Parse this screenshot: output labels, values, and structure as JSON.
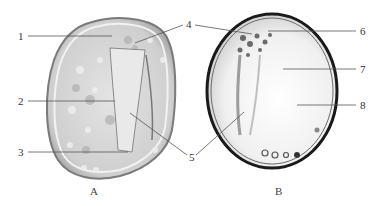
{
  "figure": {
    "panels": [
      {
        "id": "A",
        "label": "A",
        "description": "light micrograph of cell with irregular rounded outline and granular cytoplasm"
      },
      {
        "id": "B",
        "label": "B",
        "description": "light micrograph of oval cell with dark outline and large clear vacuole"
      }
    ],
    "callouts": [
      {
        "number": "1",
        "panel": "A",
        "side": "left"
      },
      {
        "number": "2",
        "panel": "A",
        "side": "left"
      },
      {
        "number": "3",
        "panel": "A",
        "side": "left"
      },
      {
        "number": "4",
        "panel": "A+B",
        "side": "top-center"
      },
      {
        "number": "5",
        "panel": "A+B",
        "side": "bottom-center"
      },
      {
        "number": "6",
        "panel": "B",
        "side": "right"
      },
      {
        "number": "7",
        "panel": "B",
        "side": "right"
      },
      {
        "number": "8",
        "panel": "B",
        "side": "right"
      }
    ],
    "caption_visible": "truncated (illegible)"
  },
  "colors": {
    "background": "#ffffff",
    "line": "#555555",
    "cell_a_fill": "#d9d9d9",
    "cell_b_outline": "#1a1a1a",
    "cell_b_fill": "#f4f4f4"
  }
}
